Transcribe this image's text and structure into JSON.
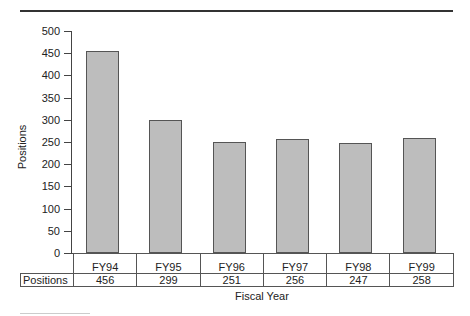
{
  "chart_data": {
    "type": "bar",
    "title": "",
    "xlabel": "Fiscal Year",
    "ylabel": "Positions",
    "categories": [
      "FY94",
      "FY95",
      "FY96",
      "FY97",
      "FY98",
      "FY99"
    ],
    "values": [
      456,
      299,
      251,
      256,
      247,
      258
    ],
    "ylim": [
      0,
      500
    ],
    "yticks": [
      0,
      50,
      100,
      150,
      200,
      250,
      300,
      350,
      400,
      450,
      500
    ],
    "grid": false,
    "data_table": {
      "row_label": "Positions",
      "values": [
        "456",
        "299",
        "251",
        "256",
        "247",
        "258"
      ]
    },
    "colors": {
      "bar_fill": "#bdbdbd",
      "bar_border": "#555555"
    }
  }
}
